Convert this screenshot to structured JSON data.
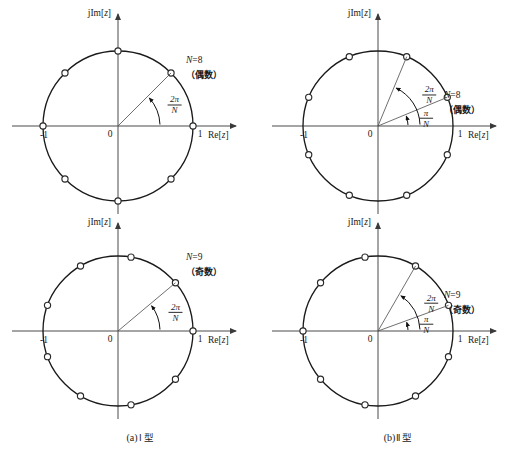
{
  "figure": {
    "title_hidden": "",
    "axis": {
      "imaginary_label": "jIm[z]",
      "real_label": "Re[z]",
      "origin_label": "0",
      "tick_left": "-1",
      "tick_right": "1"
    },
    "captions": {
      "a": "(a)",
      "a_roman": "Ⅰ",
      "a_type": "型",
      "b": "(b)",
      "b_roman": "Ⅱ",
      "b_type": "型"
    },
    "panels": [
      {
        "id": "top-left",
        "position": "top-left",
        "n_label": "N=8",
        "parity_label": "（偶数）",
        "angle_labels": [
          {
            "numerator": "2π",
            "denominator": "N",
            "value_deg": 45
          }
        ],
        "zeros_count": 8,
        "zeros_offset_deg": 0,
        "rays_deg": [
          45
        ]
      },
      {
        "id": "top-right",
        "position": "top-right",
        "n_label": "N=8",
        "parity_label": "（偶数）",
        "angle_labels": [
          {
            "numerator": "2π",
            "denominator": "N",
            "value_deg": 67.5
          },
          {
            "numerator": "π",
            "denominator": "N",
            "value_deg": 22.5
          }
        ],
        "zeros_count": 8,
        "zeros_offset_deg": 22.5,
        "rays_deg": [
          22.5,
          67.5
        ]
      },
      {
        "id": "bottom-left",
        "position": "bottom-left",
        "n_label": "N=9",
        "parity_label": "（奇数）",
        "angle_labels": [
          {
            "numerator": "2π",
            "denominator": "N",
            "value_deg": 40
          }
        ],
        "zeros_count": 9,
        "zeros_offset_deg": 0,
        "rays_deg": [
          40
        ]
      },
      {
        "id": "bottom-right",
        "position": "bottom-right",
        "n_label": "N=9",
        "parity_label": "（奇数）",
        "angle_labels": [
          {
            "numerator": "2π",
            "denominator": "N",
            "value_deg": 60
          },
          {
            "numerator": "π",
            "denominator": "N",
            "value_deg": 20
          }
        ],
        "zeros_count": 9,
        "zeros_offset_deg": 20,
        "rays_deg": [
          20,
          60
        ]
      }
    ]
  },
  "chart_data": {
    "type": "scatter",
    "xlabel": "Re[z]",
    "ylabel": "jIm[z]",
    "xlim": [
      -1.35,
      1.35
    ],
    "ylim": [
      -1.25,
      1.25
    ],
    "grid": false,
    "legend": "none",
    "subplots": [
      {
        "name": "(a)Ⅰ型 N=8 （偶数）",
        "N": 8,
        "offset_deg": 0,
        "angles_deg": [
          0,
          45,
          90,
          135,
          180,
          225,
          270,
          315
        ],
        "annotations": [
          "2π/N"
        ]
      },
      {
        "name": "(b)Ⅱ型 N=8 （偶数）",
        "N": 8,
        "offset_deg": 22.5,
        "angles_deg": [
          22.5,
          67.5,
          112.5,
          157.5,
          202.5,
          247.5,
          292.5,
          337.5
        ],
        "annotations": [
          "2π/N",
          "π/N"
        ]
      },
      {
        "name": "(a)Ⅰ型 N=9 （奇数）",
        "N": 9,
        "offset_deg": 0,
        "angles_deg": [
          0,
          40,
          80,
          120,
          160,
          200,
          240,
          280,
          320
        ],
        "annotations": [
          "2π/N"
        ]
      },
      {
        "name": "(b)Ⅱ型 N=9 （奇数）",
        "N": 9,
        "offset_deg": 20,
        "angles_deg": [
          20,
          60,
          100,
          140,
          180,
          220,
          260,
          300,
          340
        ],
        "annotations": [
          "2π/N",
          "π/N"
        ]
      }
    ]
  }
}
